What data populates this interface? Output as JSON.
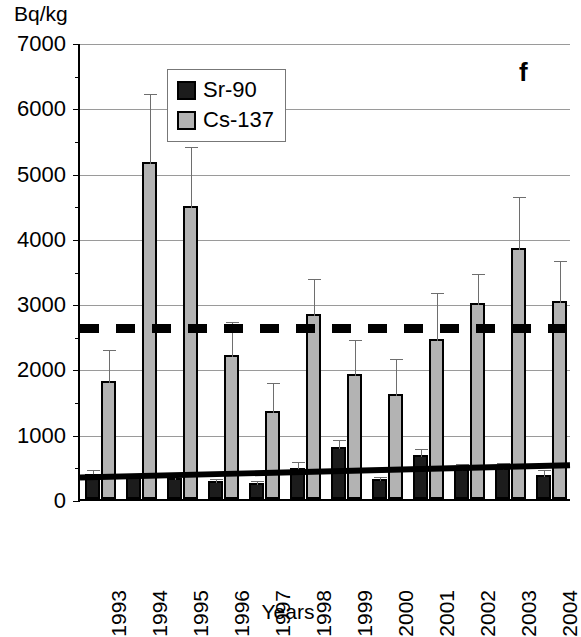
{
  "chart_data": {
    "type": "bar",
    "title": "",
    "panel_label": "f",
    "ylabel": "Bq/kg",
    "xlabel": "Years",
    "ylim": [
      0,
      7000
    ],
    "ytick_step": 1000,
    "yticks": [
      0,
      1000,
      2000,
      3000,
      4000,
      5000,
      6000,
      7000
    ],
    "ytick_labels": [
      "0",
      "1000",
      "2000",
      "3000",
      "4000",
      "5000",
      "6000",
      "7000"
    ],
    "grid": true,
    "grid_axis": "y",
    "legend_position": "top-left-inside",
    "categories": [
      "1993",
      "1994",
      "1995",
      "1996",
      "1997",
      "1998",
      "1999",
      "2000",
      "2001",
      "2002",
      "2003",
      "2004"
    ],
    "series": [
      {
        "name": "Sr-90",
        "color": "#1c1c1c",
        "values": [
          380,
          330,
          320,
          270,
          240,
          470,
          800,
          300,
          680,
          460,
          480,
          370
        ],
        "errors_upper": [
          470,
          400,
          390,
          330,
          300,
          590,
          930,
          370,
          800,
          560,
          580,
          470
        ]
      },
      {
        "name": "Cs-137",
        "color": "#b3b3b3",
        "values": [
          1810,
          5160,
          4490,
          2200,
          1350,
          2830,
          1920,
          1610,
          2450,
          3000,
          3850,
          3030
        ],
        "errors_upper": [
          2320,
          6230,
          5420,
          2740,
          1810,
          3400,
          2470,
          2180,
          3180,
          3480,
          4650,
          3680
        ]
      }
    ],
    "reference_line": {
      "label": "reference-dashed-line",
      "value": 2650,
      "style": "dashed",
      "color": "#000000"
    },
    "trend_line": {
      "label": "sr-90-trend-line",
      "start_value": 330,
      "end_value": 520,
      "style": "solid",
      "color": "#000000"
    }
  },
  "legend": {
    "items": [
      {
        "label": "Sr-90",
        "color": "#1c1c1c"
      },
      {
        "label": "Cs-137",
        "color": "#b3b3b3"
      }
    ]
  },
  "axes": {
    "y_unit_label": "Bq/kg",
    "x_title": "Years"
  }
}
